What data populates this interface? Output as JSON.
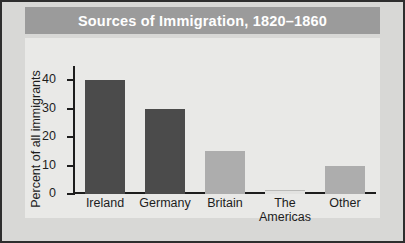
{
  "chart_data": {
    "type": "bar",
    "title": "Sources of Immigration, 1820–1860",
    "xlabel": "",
    "ylabel": "Percent of all immigrants",
    "categories": [
      "Ireland",
      "Germany",
      "Britain",
      "The Americas",
      "Other"
    ],
    "values": [
      40,
      30,
      15,
      1,
      10
    ],
    "ylim": [
      0,
      45
    ],
    "yticks": [
      0,
      10,
      20,
      30,
      40
    ],
    "ytick_labels": [
      "0",
      "10",
      "20",
      "30",
      "40"
    ],
    "grid": false,
    "legend": null,
    "bar_colors": [
      "#4b4b4b",
      "#4b4b4b",
      "#adadad",
      "#e2e2e0",
      "#adadad"
    ]
  },
  "style": {
    "title_band_color": "#9b9b9b",
    "title_text_color": "#ffffff",
    "plot_background": "#e9e9e7",
    "figure_background": "#d8d8d6",
    "axis_color": "#1d1d1d",
    "border_color": "#2e2e2e"
  },
  "category_lines": [
    [
      "Ireland"
    ],
    [
      "Germany"
    ],
    [
      "Britain"
    ],
    [
      "The",
      "Americas"
    ],
    [
      "Other"
    ]
  ]
}
